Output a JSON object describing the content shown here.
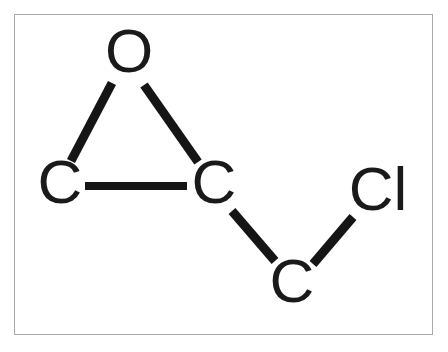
{
  "figure": {
    "kind": "chemical-structure-diagram",
    "title": "",
    "background_color": "#ffffff",
    "frame_color": "#a9a9ad",
    "ink_color": "#151515"
  },
  "molecule": {
    "atoms": [
      {
        "id": "O1",
        "label": "O",
        "element": "O",
        "x": 129,
        "y": 56,
        "font_size": 62
      },
      {
        "id": "C1",
        "label": "C",
        "element": "C",
        "x": 60,
        "y": 187,
        "font_size": 62
      },
      {
        "id": "C2",
        "label": "C",
        "element": "C",
        "x": 214,
        "y": 187,
        "font_size": 62
      },
      {
        "id": "C3",
        "label": "C",
        "element": "C",
        "x": 292,
        "y": 286,
        "font_size": 62
      },
      {
        "id": "Cl1",
        "label": "Cl",
        "element": "Cl",
        "x": 378,
        "y": 194,
        "font_size": 62
      }
    ],
    "bonds": [
      {
        "from": "O1",
        "to": "C1",
        "order": 1,
        "x1": 112,
        "y1": 83,
        "x2": 71,
        "y2": 161,
        "width": 9
      },
      {
        "from": "O1",
        "to": "C2",
        "order": 1,
        "x1": 144,
        "y1": 85,
        "x2": 198,
        "y2": 162,
        "width": 9
      },
      {
        "from": "C1",
        "to": "C2",
        "order": 1,
        "x1": 85,
        "y1": 186,
        "x2": 187,
        "y2": 186,
        "width": 8
      },
      {
        "from": "C2",
        "to": "C3",
        "order": 1,
        "x1": 232,
        "y1": 211,
        "x2": 275,
        "y2": 261,
        "width": 9
      },
      {
        "from": "C3",
        "to": "Cl1",
        "order": 1,
        "x1": 313,
        "y1": 264,
        "x2": 353,
        "y2": 217,
        "width": 9
      }
    ]
  }
}
